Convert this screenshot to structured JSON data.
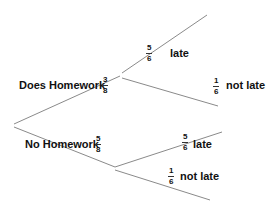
{
  "tree": {
    "first_level": [
      {
        "label": "Does Homework",
        "prob": {
          "num": "3",
          "den": "8"
        }
      },
      {
        "label": "No Homework",
        "prob": {
          "num": "5",
          "den": "8"
        }
      }
    ],
    "second_level_homework": [
      {
        "label": "late",
        "prob": {
          "num": "5",
          "den": "6"
        }
      },
      {
        "label": "not late",
        "prob": {
          "num": "1",
          "den": "6"
        }
      }
    ],
    "second_level_no_homework": [
      {
        "label": "late",
        "prob": {
          "num": "5",
          "den": "6"
        }
      },
      {
        "label": "not late",
        "prob": {
          "num": "1",
          "den": "6"
        }
      }
    ],
    "line_color": "#888888"
  }
}
